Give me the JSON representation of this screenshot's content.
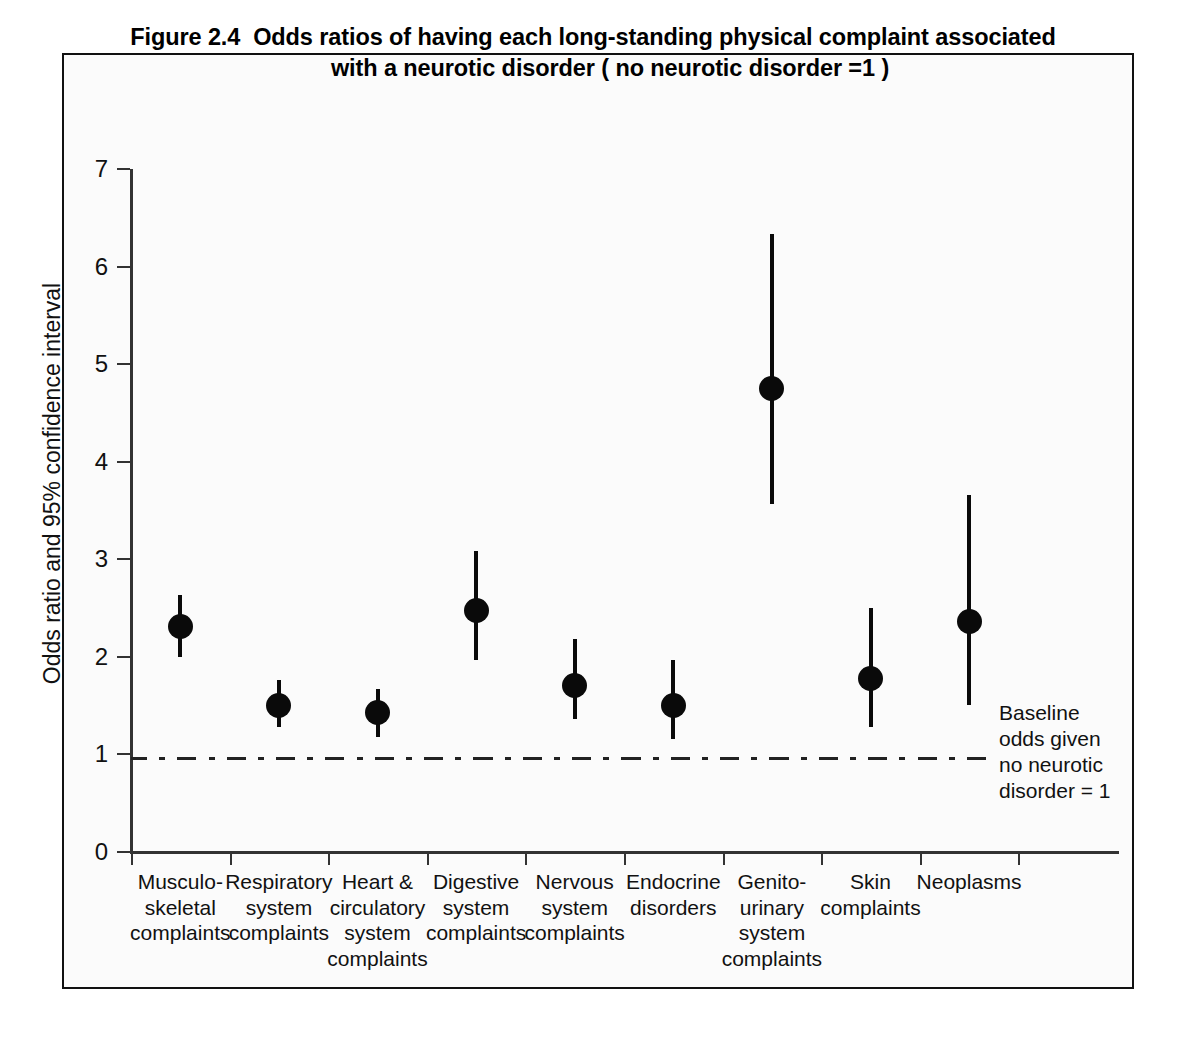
{
  "figure": {
    "title_line1": "Figure 2.4  Odds ratios of having each long-standing physical complaint associated",
    "title_line2": "with a neurotic disorder ( no neurotic disorder =1 )"
  },
  "annotation": {
    "line1": "Baseline",
    "line2": "odds given",
    "line3": "no neurotic",
    "line4": "disorder = 1"
  },
  "axis": {
    "y_ticks": [
      "0",
      "1",
      "2",
      "3",
      "4",
      "5",
      "6",
      "7"
    ],
    "y_title": "Odds ratio and 95% confidence interval"
  },
  "x_labels": [
    {
      "l1": "Musculo-",
      "l2": "skeletal",
      "l3": "complaints",
      "l4": ""
    },
    {
      "l1": "Respiratory",
      "l2": "system",
      "l3": "complaints",
      "l4": ""
    },
    {
      "l1": "Heart &",
      "l2": "circulatory",
      "l3": "system",
      "l4": "complaints"
    },
    {
      "l1": "Digestive",
      "l2": "system",
      "l3": "complaints",
      "l4": ""
    },
    {
      "l1": "Nervous",
      "l2": "system",
      "l3": "complaints",
      "l4": ""
    },
    {
      "l1": "Endocrine",
      "l2": "disorders",
      "l3": "",
      "l4": ""
    },
    {
      "l1": "Genito-",
      "l2": "urinary",
      "l3": "system",
      "l4": "complaints"
    },
    {
      "l1": "Skin",
      "l2": "complaints",
      "l3": "",
      "l4": ""
    },
    {
      "l1": "Neoplasms",
      "l2": "",
      "l3": "",
      "l4": ""
    }
  ],
  "chart_data": {
    "type": "scatter",
    "title": "Figure 2.4  Odds ratios of having each long-standing physical complaint associated with a neurotic disorder ( no neurotic disorder =1 )",
    "xlabel": "",
    "ylabel": "Odds ratio and 95% confidence interval",
    "ylim": [
      0,
      7
    ],
    "yticks": [
      0,
      1,
      2,
      3,
      4,
      5,
      6,
      7
    ],
    "grid": false,
    "legend": false,
    "reference_line": {
      "value": 1,
      "style": "dash-dot",
      "label": "Baseline odds given no neurotic disorder = 1"
    },
    "categories": [
      "Musculo-skeletal complaints",
      "Respiratory system complaints",
      "Heart & circulatory system complaints",
      "Digestive system complaints",
      "Nervous system complaints",
      "Endocrine disorders",
      "Genito-urinary system complaints",
      "Skin complaints",
      "Neoplasms"
    ],
    "values": [
      2.31,
      1.5,
      1.43,
      2.48,
      1.71,
      1.5,
      4.75,
      1.78,
      2.36
    ],
    "ci_lower": [
      2.0,
      1.28,
      1.18,
      1.97,
      1.36,
      1.16,
      3.57,
      1.28,
      1.51
    ],
    "ci_upper": [
      2.63,
      1.76,
      1.67,
      3.08,
      2.18,
      1.97,
      6.33,
      2.5,
      3.66
    ]
  }
}
